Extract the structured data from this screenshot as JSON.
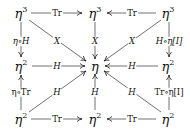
{
  "diagram": {
    "type": "commutative-diagram",
    "nodes": {
      "top_left": {
        "base": "η",
        "exp": "3"
      },
      "top_center": {
        "base": "η",
        "exp": "3"
      },
      "top_right": {
        "base": "η",
        "exp": "3"
      },
      "mid_left": {
        "base": "η",
        "exp": "2"
      },
      "center": {
        "base": "η",
        "exp": ""
      },
      "mid_right": {
        "base": "η",
        "exp": "2"
      },
      "bot_left": {
        "base": "η",
        "exp": "2"
      },
      "bot_center": {
        "base": "η",
        "exp": "2"
      },
      "bot_right": {
        "base": "η",
        "exp": "2"
      }
    },
    "arrows": {
      "top_left_to_top_center": "Tr",
      "top_right_to_top_center": "Tr",
      "top_left_to_mid_left": "η∘H",
      "top_right_to_mid_right": "H∘η[I]",
      "top_left_to_center": "X",
      "top_center_to_center": "X",
      "top_right_to_center": "X",
      "mid_left_to_center": "H",
      "mid_right_to_center": "H",
      "bot_left_to_mid_left": "η∘Tr",
      "bot_right_to_mid_right": "Tr∘η[I]",
      "bot_left_to_center": "H",
      "bot_center_to_center": "H",
      "bot_right_to_center": "H",
      "bot_left_to_bot_center": "Tr",
      "bot_right_to_bot_center": "Tr"
    }
  }
}
